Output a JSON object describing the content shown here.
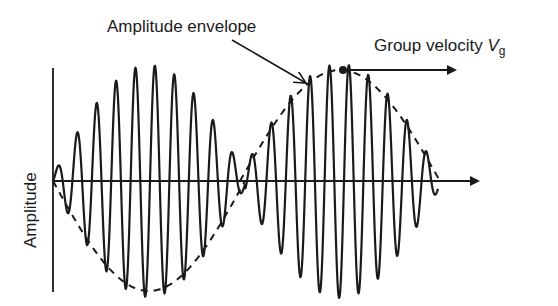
{
  "figure": {
    "type": "wave-packet-diagram",
    "colors": {
      "ink": "#1a1a1a",
      "background": "#ffffff"
    },
    "labels": {
      "envelope": "Amplitude envelope",
      "group_velocity_text": "Group velocity ",
      "group_velocity_symbol": "V",
      "group_velocity_subscript": "g",
      "y_axis": "Amplitude"
    },
    "axes": {
      "origin_x": 53,
      "baseline_y": 181,
      "y_axis_top": 68,
      "y_axis_bottom": 292,
      "x_axis_end": 478
    },
    "envelope": {
      "style": "dashed",
      "packet_1": {
        "x_start": 53,
        "x_end": 245,
        "amplitude": 110,
        "dashed_half": "lower"
      },
      "packet_2": {
        "x_start": 240,
        "x_end": 440,
        "amplitude": 111,
        "dashed_half": "upper"
      }
    },
    "carrier": {
      "wavelength_px": 19.4,
      "x_start": 53,
      "x_end": 438
    },
    "group_velocity_arrow": {
      "x_start": 343,
      "x_end": 455,
      "y": 70,
      "dot_x": 343,
      "dot_y": 70
    },
    "envelope_pointer_arrow": {
      "x_start": 232,
      "y_start": 40,
      "x_end": 306,
      "y_end": 83
    }
  }
}
